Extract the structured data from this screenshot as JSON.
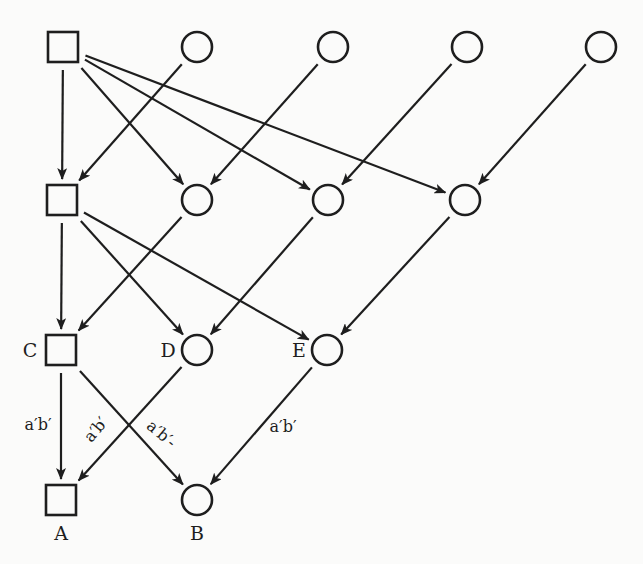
{
  "diagram": {
    "type": "directed-graph",
    "nodes": [
      {
        "id": "s1",
        "shape": "square",
        "label": ""
      },
      {
        "id": "c11",
        "shape": "circle",
        "label": ""
      },
      {
        "id": "c12",
        "shape": "circle",
        "label": ""
      },
      {
        "id": "c13",
        "shape": "circle",
        "label": ""
      },
      {
        "id": "c14",
        "shape": "circle",
        "label": ""
      },
      {
        "id": "s2",
        "shape": "square",
        "label": ""
      },
      {
        "id": "c21",
        "shape": "circle",
        "label": ""
      },
      {
        "id": "c22",
        "shape": "circle",
        "label": ""
      },
      {
        "id": "c23",
        "shape": "circle",
        "label": ""
      },
      {
        "id": "C",
        "shape": "square",
        "label": "C"
      },
      {
        "id": "D",
        "shape": "circle",
        "label": "D"
      },
      {
        "id": "E",
        "shape": "circle",
        "label": "E"
      },
      {
        "id": "A",
        "shape": "square",
        "label": "A"
      },
      {
        "id": "B",
        "shape": "circle",
        "label": "B"
      }
    ],
    "edges": [
      {
        "from": "s1",
        "to": "s2",
        "label": ""
      },
      {
        "from": "s1",
        "to": "c21",
        "label": ""
      },
      {
        "from": "s1",
        "to": "c22",
        "label": ""
      },
      {
        "from": "s1",
        "to": "c23",
        "label": ""
      },
      {
        "from": "c11",
        "to": "s2",
        "label": ""
      },
      {
        "from": "c12",
        "to": "c21",
        "label": ""
      },
      {
        "from": "c13",
        "to": "c22",
        "label": ""
      },
      {
        "from": "c14",
        "to": "c23",
        "label": ""
      },
      {
        "from": "s2",
        "to": "C",
        "label": ""
      },
      {
        "from": "s2",
        "to": "D",
        "label": ""
      },
      {
        "from": "s2",
        "to": "E",
        "label": ""
      },
      {
        "from": "c21",
        "to": "C",
        "label": ""
      },
      {
        "from": "c22",
        "to": "D",
        "label": ""
      },
      {
        "from": "c23",
        "to": "E",
        "label": ""
      },
      {
        "from": "C",
        "to": "A",
        "label": "a′b′"
      },
      {
        "from": "C",
        "to": "B",
        "label": "a′b′-"
      },
      {
        "from": "D",
        "to": "A",
        "label": "a′b′"
      },
      {
        "from": "E",
        "to": "B",
        "label": "a′b′"
      }
    ]
  }
}
